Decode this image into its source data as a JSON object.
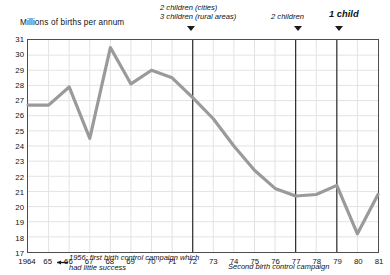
{
  "chart_data": {
    "type": "line",
    "title": "",
    "ylabel": "Millions of births per annum",
    "xlabel": "",
    "ylim": [
      17,
      31
    ],
    "yticks": [
      31,
      30,
      29,
      28,
      27,
      26,
      25,
      24,
      23,
      22,
      21,
      20,
      19,
      18,
      17
    ],
    "xticks": [
      "1964",
      "65",
      "66",
      "67",
      "68",
      "69",
      "70",
      "71",
      "72",
      "73",
      "74",
      "75",
      "76",
      "77",
      "78",
      "79",
      "80",
      "81"
    ],
    "x": [
      1964,
      1965,
      1966,
      1967,
      1968,
      1969,
      1970,
      1971,
      1972,
      1973,
      1974,
      1975,
      1976,
      1977,
      1978,
      1979,
      1980,
      1981
    ],
    "series": [
      {
        "name": "Births",
        "values": [
          26.7,
          26.7,
          27.9,
          24.5,
          30.5,
          28.1,
          29.0,
          28.5,
          27.2,
          25.8,
          24.0,
          22.4,
          21.2,
          20.7,
          20.8,
          21.4,
          18.2,
          20.8
        ],
        "color": "#9a9a9a"
      }
    ],
    "grid": true,
    "legend": null,
    "line_color": "#9a9a9a",
    "annotations": [
      {
        "name": "policy-marker-1972",
        "x": 1972,
        "lines": [
          "2 children (cities)",
          "3 children (rural areas)"
        ],
        "bold": false
      },
      {
        "name": "policy-marker-1977",
        "x": 1977,
        "lines": [
          "2 children"
        ],
        "bold": false
      },
      {
        "name": "policy-marker-1979",
        "x": 1979,
        "lines": [
          "1 child"
        ],
        "bold": true
      }
    ],
    "inline_notes": [
      {
        "name": "note-1956",
        "lines": [
          "1956: first birth control campaign which",
          "had little success"
        ]
      },
      {
        "name": "note-second-campaign",
        "lines": [
          "Second birth control campaign"
        ]
      }
    ],
    "vertical_lines": [
      1972,
      1977,
      1979
    ]
  },
  "markers": {
    "m1_line1": "2 children (cities)",
    "m1_line2": "3 children (rural areas)",
    "m2_line1": "2 children",
    "m3_line1": "1 child"
  },
  "notes": {
    "n1_line1": "1956: first birth control campaign which",
    "n1_line2": "had little success",
    "n2_line1": "Second birth control campaign"
  },
  "axis": {
    "ylabel": "Millions of births per annum"
  }
}
